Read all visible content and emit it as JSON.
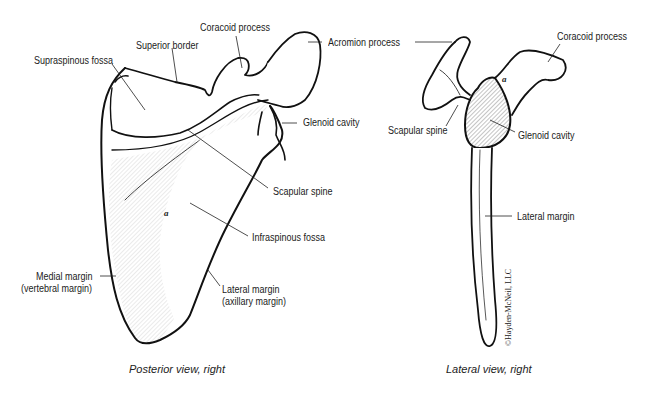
{
  "posterior": {
    "caption": "Posterior view, right",
    "marker": "a",
    "labels": {
      "supraspinous_fossa": "Supraspinous fossa",
      "superior_border": "Superior border",
      "coracoid_process": "Coracoid process",
      "acromion_process": "Acromion process",
      "glenoid_cavity": "Glenoid cavity",
      "scapular_spine": "Scapular spine",
      "infraspinous_fossa": "Infraspinous fossa",
      "medial_margin_1": "Medial margin",
      "medial_margin_2": "(vertebral margin)",
      "lateral_margin_1": "Lateral margin",
      "lateral_margin_2": "(axillary margin)"
    }
  },
  "lateral": {
    "caption": "Lateral view, right",
    "marker": "a",
    "labels": {
      "coracoid_process": "Coracoid process",
      "scapular_spine": "Scapular spine",
      "glenoid_cavity": "Glenoid cavity",
      "lateral_margin": "Lateral margin"
    },
    "copyright": "©Hayden-McNeil, LLC"
  }
}
